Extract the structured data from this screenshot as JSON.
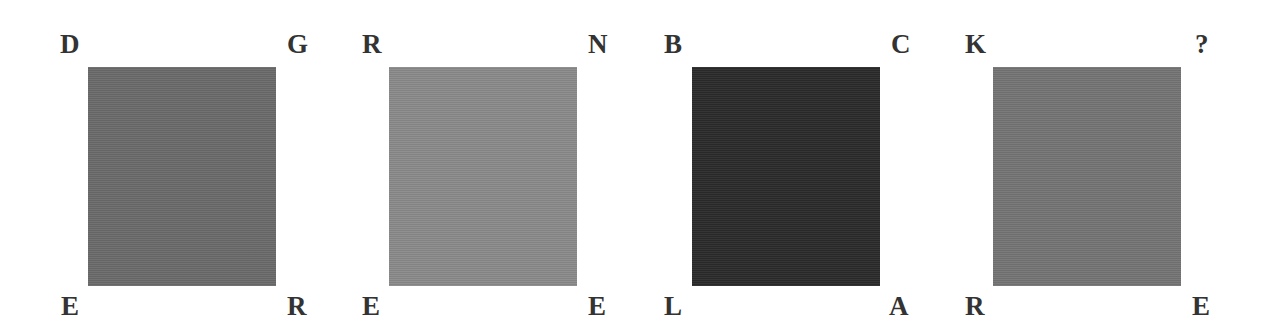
{
  "puzzle": {
    "panels": [
      {
        "color": "#6a6a6a",
        "top_left": "D",
        "top_right": "G",
        "bottom_left": "E",
        "bottom_right": "R"
      },
      {
        "color": "#8a8a8a",
        "top_left": "R",
        "top_right": "N",
        "bottom_left": "E",
        "bottom_right": "E"
      },
      {
        "color": "#2a2a2a",
        "top_left": "B",
        "top_right": "C",
        "bottom_left": "L",
        "bottom_right": "A"
      },
      {
        "color": "#747474",
        "top_left": "K",
        "top_right": "?",
        "bottom_left": "R",
        "bottom_right": "E"
      }
    ]
  }
}
